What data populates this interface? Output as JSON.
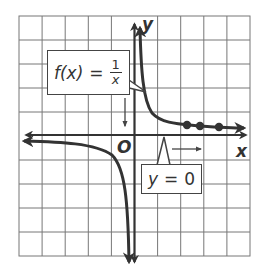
{
  "diagram": {
    "function_label": {
      "name": "f(x)",
      "equals": "=",
      "numerator": "1",
      "denominator": "x"
    },
    "asymptote_label": {
      "variable": "y",
      "equals": "=",
      "value": "0"
    },
    "axes": {
      "x_label": "x",
      "y_label": "y",
      "origin_label": "O"
    },
    "grid": {
      "columns": 10,
      "rows": 10,
      "unit_per_square": 1,
      "x_range": [
        -5,
        5
      ],
      "y_range": [
        -5,
        5
      ]
    },
    "highlighted_points": [
      {
        "x": 2.3,
        "y": 0.43
      },
      {
        "x": 2.8,
        "y": 0.36
      },
      {
        "x": 3.6,
        "y": 0.28
      }
    ],
    "annotations": [
      {
        "type": "arrow-down",
        "meaning": "as x approaches 0 from the left, f(x) decreases without bound"
      },
      {
        "type": "arrow-right",
        "meaning": "as x increases, f(x) approaches y = 0"
      }
    ],
    "colors": {
      "grid": "#777777",
      "curve": "#333333",
      "axes": "#333333",
      "background": "#ffffff"
    }
  }
}
